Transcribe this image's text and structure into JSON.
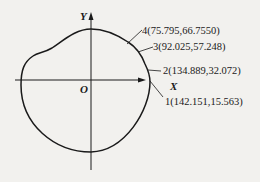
{
  "diagram": {
    "type": "cam-profile-curve",
    "axes": {
      "x_label": "X",
      "y_label": "Y",
      "origin_label": "O"
    },
    "points": [
      {
        "id": "1",
        "label": "1(142.151,15.563)",
        "x": 142.151,
        "y": 15.563
      },
      {
        "id": "2",
        "label": "2(134.889,32.072)",
        "x": 134.889,
        "y": 32.072
      },
      {
        "id": "3",
        "label": "3(92.025,57.248)",
        "x": 92.025,
        "y": 57.248
      },
      {
        "id": "4",
        "label": "4(75.795,66.7550)",
        "x": 75.795,
        "y": 66.755
      }
    ],
    "colors": {
      "background": "#f2f1ee",
      "stroke": "#1a1a1a"
    }
  }
}
